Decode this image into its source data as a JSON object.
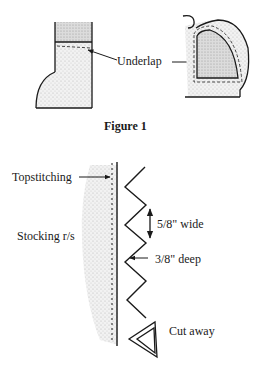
{
  "figure1": {
    "caption": "Figure 1",
    "label_underlap": "Underlap"
  },
  "figure2": {
    "label_topstitching": "Topstitching",
    "label_stocking": "Stocking r/s",
    "label_wide": "5/8\" wide",
    "label_deep": "3/8\" deep",
    "label_cut_away": "Cut away"
  },
  "colors": {
    "line": "#1a1a1a",
    "stipple": "#d9d9d9",
    "background": "#ffffff"
  }
}
